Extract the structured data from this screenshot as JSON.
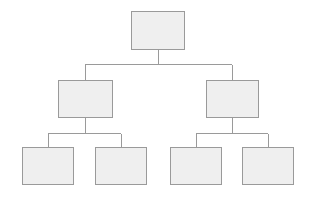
{
  "diagram": {
    "type": "org-chart-tree",
    "title": "",
    "background_color": "#ffffff",
    "node_fill_color": "#efefef",
    "node_border_color": "#9a9a9a",
    "connector_color": "#9a9a9a",
    "connector_width": 1,
    "levels": 3,
    "node_count": 7,
    "nodes": [
      {
        "id": "root",
        "label": "",
        "level": 0,
        "x": 131,
        "y": 11,
        "width": 54,
        "height": 39
      },
      {
        "id": "branch-left",
        "label": "",
        "level": 1,
        "x": 58,
        "y": 80,
        "width": 55,
        "height": 38
      },
      {
        "id": "branch-right",
        "label": "",
        "level": 1,
        "x": 206,
        "y": 80,
        "width": 53,
        "height": 38
      },
      {
        "id": "leaf-1",
        "label": "",
        "level": 2,
        "x": 22,
        "y": 147,
        "width": 52,
        "height": 38
      },
      {
        "id": "leaf-2",
        "label": "",
        "level": 2,
        "x": 95,
        "y": 147,
        "width": 52,
        "height": 38
      },
      {
        "id": "leaf-3",
        "label": "",
        "level": 2,
        "x": 170,
        "y": 147,
        "width": 52,
        "height": 38
      },
      {
        "id": "leaf-4",
        "label": "",
        "level": 2,
        "x": 242,
        "y": 147,
        "width": 52,
        "height": 38
      }
    ],
    "edges": [
      {
        "from": "root",
        "to": "branch-left"
      },
      {
        "from": "root",
        "to": "branch-right"
      },
      {
        "from": "branch-left",
        "to": "leaf-1"
      },
      {
        "from": "branch-left",
        "to": "leaf-2"
      },
      {
        "from": "branch-right",
        "to": "leaf-3"
      },
      {
        "from": "branch-right",
        "to": "leaf-4"
      }
    ],
    "connector_geometry": {
      "root_stem": {
        "x": 158,
        "y1": 50,
        "y2": 64
      },
      "level1_bus": {
        "y": 64,
        "x1": 85,
        "x2": 232
      },
      "level1_drops": [
        {
          "x": 85,
          "y1": 64,
          "y2": 80
        },
        {
          "x": 232,
          "y1": 64,
          "y2": 80
        }
      ],
      "branch_left_stem": {
        "x": 85,
        "y1": 118,
        "y2": 133
      },
      "branch_right_stem": {
        "x": 232,
        "y1": 118,
        "y2": 133
      },
      "level2_bus_left": {
        "y": 133,
        "x1": 48,
        "x2": 121
      },
      "level2_bus_right": {
        "y": 133,
        "x1": 196,
        "x2": 268
      },
      "level2_drops": [
        {
          "x": 48,
          "y1": 133,
          "y2": 147
        },
        {
          "x": 121,
          "y1": 133,
          "y2": 147
        },
        {
          "x": 196,
          "y1": 133,
          "y2": 147
        },
        {
          "x": 268,
          "y1": 133,
          "y2": 147
        }
      ]
    }
  }
}
